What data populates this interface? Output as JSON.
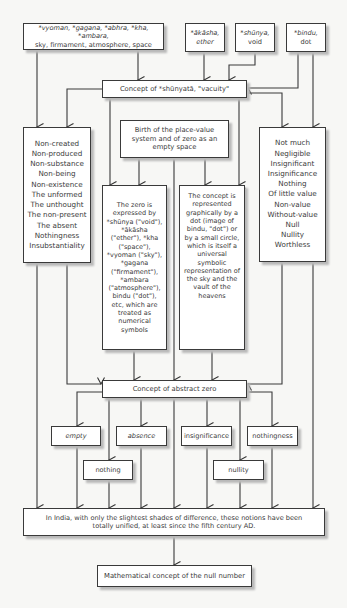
{
  "sources": {
    "sky_terms": {
      "line1": "*vyoman, *gagana, *abhra, *kha, *ambara,",
      "line2": "sky, firmament, atmosphere, space"
    },
    "akasha": {
      "line1": "*ākāsha,",
      "line2": "ether"
    },
    "shunya": {
      "line1": "*shūnya,",
      "line2": "void"
    },
    "bindu": {
      "line1": "*bindu,",
      "line2": "dot"
    }
  },
  "shunyata_concept": "Concept of *shūnyatā, \"vacuity\"",
  "left_list": [
    "Non-created",
    "Non-produced",
    "Non-substance",
    "Non-being",
    "Non-existence",
    "The unformed",
    "The unthought",
    "The non-present",
    "The absent",
    "Nothingness",
    "Insubstantiality"
  ],
  "right_list": [
    "Not much",
    "Negligible",
    "Insignificant",
    "Insignificance",
    "Nothing",
    "Of little value",
    "Non-value",
    "Without-value",
    "Null",
    "Nullity",
    "Worthless"
  ],
  "birth_box": "Birth of the place-value system and of zero as an empty space",
  "zero_expressed": "The zero is expressed by *shūnya (\"void\"), *ākāsha (\"ether\"), *kha (\"space\"), *vyoman (\"sky\"), *gagana (\"firmament\"), *ambara (\"atmosphere\"), bindu (\"dot\"), etc, which are treated as numerical symbols",
  "concept_represented": "The concept is represented graphically by a dot (image of bindu, \"dot\") or by a small circle, which is itself a universal symbolic representation of the sky and the vault of the heavens",
  "abstract_zero": "Concept of abstract zero",
  "notions": {
    "empty": "empty",
    "absence": "absence",
    "insignificance": "insignificance",
    "nothingness": "nothingness",
    "nothing": "nothing",
    "nullity": "nullity"
  },
  "unified_statement": "In India, with only the slightest shades of difference, these notions have been totally unified, at least since the fifth century AD.",
  "null_number": "Mathematical concept of the null number"
}
